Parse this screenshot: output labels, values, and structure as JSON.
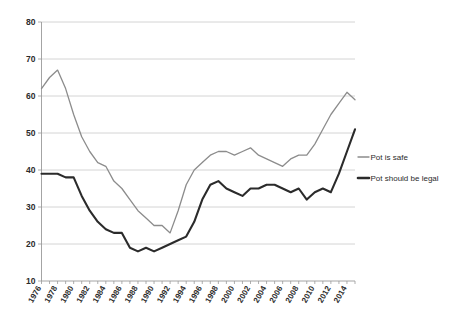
{
  "chart_data": {
    "type": "line",
    "title": "",
    "subtitle": "",
    "xlabel": "",
    "ylabel": "",
    "ylim": [
      10,
      80
    ],
    "ytick_values": [
      10,
      20,
      30,
      40,
      50,
      60,
      70,
      80
    ],
    "ytick_labels": [
      "10",
      "20",
      "30",
      "40",
      "50",
      "60",
      "70",
      "80"
    ],
    "xtick_labels": [
      "1976",
      "1978",
      "1980",
      "1982",
      "1984",
      "1986",
      "1988",
      "1990",
      "1992",
      "1994",
      "1996",
      "1998",
      "2000",
      "2002",
      "2004",
      "2006",
      "2008",
      "2010",
      "2012",
      "2014"
    ],
    "xlim": [
      1976,
      2015
    ],
    "grid": "horizontal",
    "legend_position": "right",
    "x": [
      1976,
      1977,
      1978,
      1979,
      1980,
      1981,
      1982,
      1983,
      1984,
      1985,
      1986,
      1987,
      1988,
      1989,
      1990,
      1991,
      1992,
      1993,
      1994,
      1995,
      1996,
      1997,
      1998,
      1999,
      2000,
      2001,
      2002,
      2003,
      2004,
      2005,
      2006,
      2007,
      2008,
      2009,
      2010,
      2011,
      2012,
      2013,
      2014,
      2015
    ],
    "series": [
      {
        "name": "Pot is safe",
        "color": "#8c8c8c",
        "stroke_width": 1.3,
        "values": [
          62,
          65,
          67,
          62,
          55,
          49,
          45,
          42,
          41,
          37,
          35,
          32,
          29,
          27,
          25,
          25,
          23,
          29,
          36,
          40,
          42,
          44,
          45,
          45,
          44,
          45,
          46,
          44,
          43,
          42,
          41,
          43,
          44,
          44,
          47,
          51,
          55,
          58,
          61,
          59
        ]
      },
      {
        "name": "Pot should be legal",
        "color": "#2b2b2b",
        "stroke_width": 2.1,
        "values": [
          39,
          39,
          39,
          38,
          38,
          33,
          29,
          26,
          24,
          23,
          23,
          19,
          18,
          19,
          18,
          19,
          20,
          21,
          22,
          26,
          32,
          36,
          37,
          35,
          34,
          33,
          35,
          35,
          36,
          36,
          35,
          34,
          35,
          32,
          34,
          35,
          34,
          39,
          45,
          51
        ]
      }
    ],
    "legend": [
      {
        "label": "Pot is safe",
        "color": "#8c8c8c",
        "width": 1.3
      },
      {
        "label": "Pot should be legal",
        "color": "#2b2b2b",
        "width": 2.6
      }
    ]
  }
}
